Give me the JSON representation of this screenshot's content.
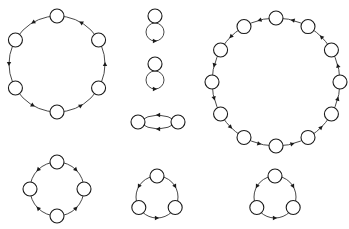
{
  "diagram": {
    "node_radius": 7,
    "colors": {
      "node_fill": "#ffffff",
      "stroke": "#1a1a1a"
    },
    "graphs": [
      {
        "id": "cycle-6",
        "type": "cycle",
        "n": 6,
        "cx": 57,
        "cy": 64,
        "r": 48,
        "start_deg": -90,
        "direction": "ccw"
      },
      {
        "id": "self-loop-1",
        "type": "loop",
        "x": 155,
        "y": 16,
        "loop_cx": 155,
        "loop_cy": 32,
        "loop_r": 9
      },
      {
        "id": "self-loop-2",
        "type": "loop",
        "x": 155,
        "y": 64,
        "loop_cx": 155,
        "loop_cy": 80,
        "loop_r": 9
      },
      {
        "id": "cycle-2",
        "type": "pair",
        "x1": 138,
        "y1": 122,
        "x2": 178,
        "y2": 122
      },
      {
        "id": "cycle-12",
        "type": "cycle",
        "n": 12,
        "cx": 276,
        "cy": 82,
        "r": 64,
        "start_deg": -90,
        "direction": "ccw"
      },
      {
        "id": "cycle-4",
        "type": "cycle",
        "n": 4,
        "cx": 57,
        "cy": 189,
        "r": 27,
        "start_deg": -90,
        "direction": "mixed"
      },
      {
        "id": "cycle-3-a",
        "type": "cycle",
        "n": 3,
        "cx": 157,
        "cy": 197,
        "r": 21,
        "start_deg": -90,
        "direction": "mixed"
      },
      {
        "id": "cycle-3-b",
        "type": "cycle",
        "n": 3,
        "cx": 275,
        "cy": 197,
        "r": 21,
        "start_deg": -90,
        "direction": "mixed"
      }
    ]
  }
}
